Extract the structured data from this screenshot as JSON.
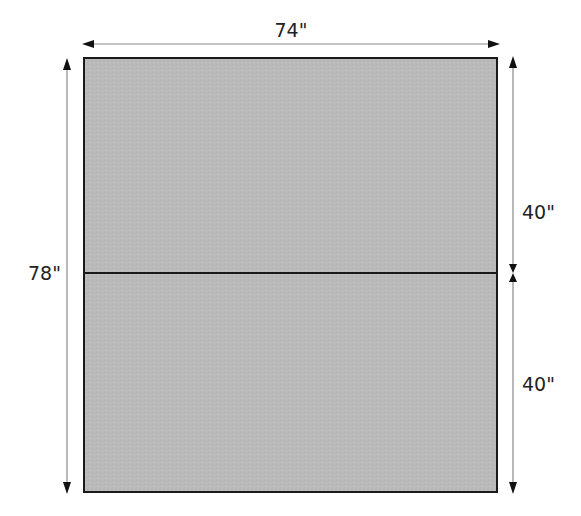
{
  "diagram": {
    "type": "dimensioned-rectangle",
    "colors": {
      "panel_fill": "#b9b9b9",
      "outline": "#1a1a1a",
      "arrow": "#888888",
      "arrowhead": "#111111",
      "text": "#222222"
    },
    "dimensions": {
      "width_label": "74\"",
      "height_label": "78\"",
      "top_panel_label": "40\"",
      "bottom_panel_label": "40\""
    },
    "panels": [
      {
        "name": "top-panel",
        "height_label": "40\""
      },
      {
        "name": "bottom-panel",
        "height_label": "40\""
      }
    ]
  }
}
